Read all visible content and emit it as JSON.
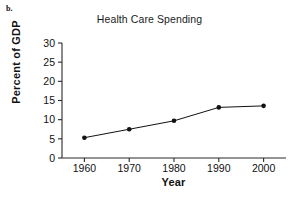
{
  "panel": {
    "label": "b."
  },
  "chart_data": {
    "type": "line",
    "title": "Health Care Spending",
    "xlabel": "Year",
    "ylabel": "Percent of GDP",
    "categories": [
      "1960",
      "1970",
      "1980",
      "1990",
      "2000"
    ],
    "x": [
      1960,
      1970,
      1980,
      1990,
      2000
    ],
    "values": [
      5.3,
      7.5,
      9.7,
      13.2,
      13.6
    ],
    "xlim": [
      1955,
      2005
    ],
    "ylim": [
      0,
      30
    ],
    "xticks": [
      "1960",
      "1970",
      "1980",
      "1990",
      "2000"
    ],
    "yticks": [
      "0",
      "5",
      "10",
      "15",
      "20",
      "25",
      "30"
    ],
    "ytick_values": [
      0,
      5,
      10,
      15,
      20,
      25,
      30
    ],
    "grid": false,
    "legend": "none",
    "marker": "filled-circle",
    "line_color": "#111111",
    "marker_color": "#111111",
    "axis_color": "#2b2b2b",
    "background": "#ffffff"
  }
}
